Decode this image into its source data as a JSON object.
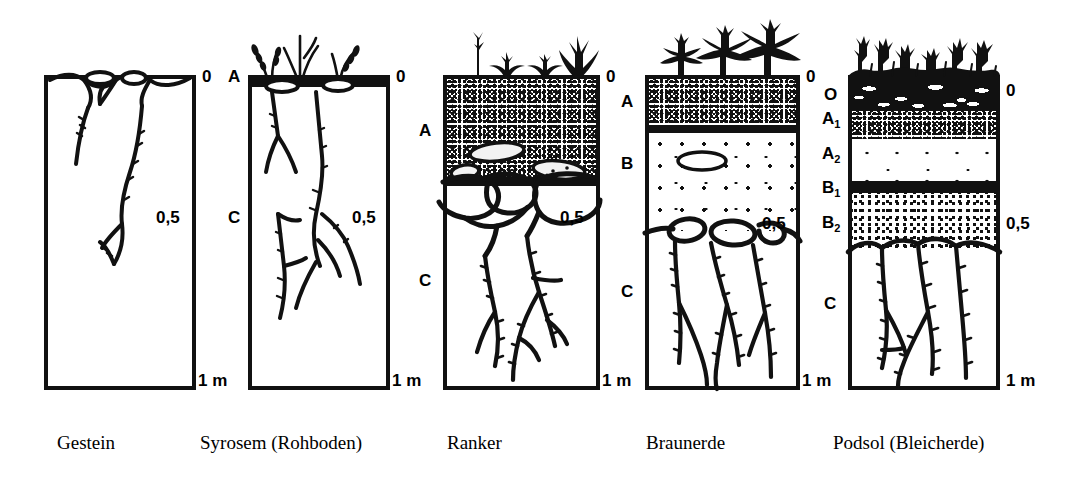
{
  "figure": {
    "title": "",
    "unit_top": "0",
    "unit_mid": "0,5",
    "unit_bottom": "1 m"
  },
  "profiles": [
    {
      "id": "gestein",
      "caption": "Gestein",
      "left_labels": [],
      "right_labels": [
        {
          "text": "0",
          "pos": "top"
        },
        {
          "text": "0,5",
          "pos": "mid"
        },
        {
          "text": "1 m",
          "pos": "bottom"
        }
      ],
      "horizons": [
        {
          "code": "",
          "fill": "white",
          "depth_pct": 100
        }
      ],
      "vegetation": "none"
    },
    {
      "id": "syrosem",
      "caption": "Syrosem (Rohboden)",
      "left_labels": [
        {
          "text": "A",
          "pos": "top"
        },
        {
          "text": "C",
          "pos": "mid"
        }
      ],
      "right_labels": [
        {
          "text": "0",
          "pos": "top"
        },
        {
          "text": "0,5",
          "pos": "mid"
        },
        {
          "text": "1 m",
          "pos": "bottom"
        }
      ],
      "horizons": [
        {
          "code": "A",
          "fill": "solid",
          "depth_pct": 3
        },
        {
          "code": "C",
          "fill": "white",
          "depth_pct": 97
        }
      ],
      "vegetation": "sparse-grass"
    },
    {
      "id": "ranker",
      "caption": "Ranker",
      "left_labels": [
        {
          "text": "A",
          "pos": "a"
        },
        {
          "text": "C",
          "pos": "c"
        }
      ],
      "right_labels": [
        {
          "text": "0",
          "pos": "top"
        },
        {
          "text": "0,5",
          "pos": "mid"
        },
        {
          "text": "1 m",
          "pos": "bottom"
        }
      ],
      "horizons": [
        {
          "code": "A",
          "fill": "dense",
          "depth_pct": 33
        },
        {
          "code": "C",
          "fill": "white",
          "depth_pct": 67
        }
      ],
      "vegetation": "grass-tufts"
    },
    {
      "id": "braunerde",
      "caption": "Braunerde",
      "left_labels": [
        {
          "text": "A",
          "pos": "a"
        },
        {
          "text": "B",
          "pos": "b"
        },
        {
          "text": "C",
          "pos": "c"
        }
      ],
      "right_labels": [
        {
          "text": "0",
          "pos": "top"
        },
        {
          "text": "0,5",
          "pos": "mid"
        },
        {
          "text": "1 m",
          "pos": "bottom"
        }
      ],
      "horizons": [
        {
          "code": "A",
          "fill": "dense",
          "depth_pct": 16
        },
        {
          "code": "B",
          "fill": "sparse",
          "depth_pct": 31
        },
        {
          "code": "C",
          "fill": "white",
          "depth_pct": 53
        }
      ],
      "vegetation": "conifers"
    },
    {
      "id": "podsol",
      "caption": "Podsol (Bleicherde)",
      "left_labels": [
        {
          "text": "O",
          "pos": "o"
        },
        {
          "text": "A",
          "sub": "1",
          "pos": "a1"
        },
        {
          "text": "A",
          "sub": "2",
          "pos": "a2"
        },
        {
          "text": "B",
          "sub": "1",
          "pos": "b1"
        },
        {
          "text": "B",
          "sub": "2",
          "pos": "b2"
        },
        {
          "text": "C",
          "pos": "c"
        }
      ],
      "right_labels": [
        {
          "text": "0",
          "pos": "top"
        },
        {
          "text": "0,5",
          "pos": "mid"
        },
        {
          "text": "1 m",
          "pos": "bottom"
        }
      ],
      "horizons": [
        {
          "code": "O",
          "fill": "black-litter",
          "depth_pct": 10
        },
        {
          "code": "A1",
          "fill": "dense",
          "depth_pct": 9
        },
        {
          "code": "A2",
          "fill": "verysparse",
          "depth_pct": 13
        },
        {
          "code": "B1",
          "fill": "solid",
          "depth_pct": 4
        },
        {
          "code": "B2",
          "fill": "medium",
          "depth_pct": 18
        },
        {
          "code": "C",
          "fill": "white",
          "depth_pct": 46
        }
      ],
      "vegetation": "dwarf-shrubs"
    }
  ],
  "colors": {
    "ink": "#111111",
    "paper": "#ffffff"
  }
}
